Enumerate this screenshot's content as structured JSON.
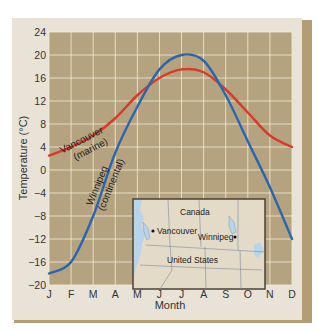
{
  "chart_data": {
    "type": "line",
    "title": "",
    "xlabel": "Month",
    "ylabel": "Temperature (°C)",
    "categories": [
      "J",
      "F",
      "M",
      "A",
      "M",
      "J",
      "J",
      "A",
      "S",
      "O",
      "N",
      "D"
    ],
    "yticks": [
      24,
      20,
      16,
      12,
      8,
      4,
      0,
      -4,
      -8,
      -12,
      -16,
      -20
    ],
    "ylim": [
      -20,
      24
    ],
    "grid": true,
    "series": [
      {
        "name": "Vancouver (marine)",
        "label_line1": "Vancouver",
        "label_line2": "(marine)",
        "color": "#d93a2b",
        "values": [
          2.5,
          4,
          6,
          9,
          13,
          16,
          17.5,
          17,
          14,
          10,
          6,
          4
        ]
      },
      {
        "name": "Winnipeg (continental)",
        "label_line1": "Winnipeg",
        "label_line2": "(continental)",
        "color": "#2a66b0",
        "values": [
          -18,
          -16,
          -8,
          3,
          11,
          17.5,
          20,
          19,
          13,
          5,
          -3,
          -12
        ]
      }
    ],
    "inset_map": {
      "labels": [
        "Canada",
        "Vancouver",
        "Winnipeg",
        "United States"
      ]
    }
  },
  "colors": {
    "plot_bg": "#b5a27f",
    "panel_bg": "#e8e3d6",
    "frame_dark": "#b49c74",
    "grid": "#f3ecd6",
    "map_land": "#e3dbc8",
    "map_water": "#b8d4ea"
  }
}
